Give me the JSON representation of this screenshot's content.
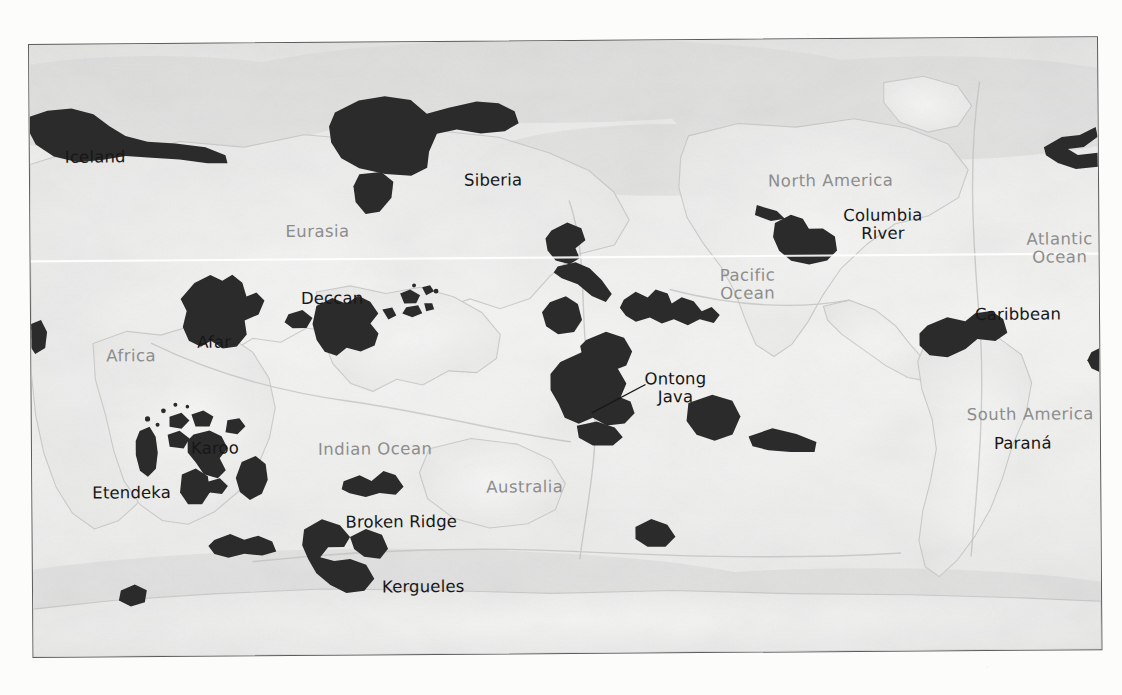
{
  "figure": {
    "type": "world-map",
    "projection": "equirectangular",
    "basemap_style": "grayscale shaded relief",
    "frame_border_color": "#5c5c5c",
    "lip_fill_color": "#2b2b2b",
    "region_label_color": "#8d8d8d",
    "lip_label_color": "#171717",
    "equator_line_color": "#ffffff"
  },
  "region_labels": [
    {
      "name": "eurasia",
      "text": "Eurasia",
      "x": 255,
      "y": 180
    },
    {
      "name": "north-america",
      "text": "North America",
      "x": 738,
      "y": 133
    },
    {
      "name": "pacific-ocean",
      "text": "Pacific",
      "text2": "Ocean",
      "x": 689,
      "y": 227
    },
    {
      "name": "atlantic-ocean",
      "text": "Atlantic",
      "text2": "Ocean",
      "x": 996,
      "y": 193
    },
    {
      "name": "africa",
      "text": "Africa",
      "x": 75,
      "y": 303
    },
    {
      "name": "south-america",
      "text": "South America",
      "x": 935,
      "y": 368
    },
    {
      "name": "indian-ocean",
      "text": "Indian Ocean",
      "x": 286,
      "y": 398
    },
    {
      "name": "australia",
      "text": "Australia",
      "x": 454,
      "y": 437
    },
    {
      "name": "antarctic",
      "text": "Antarctic",
      "x": 305,
      "y": 617
    }
  ],
  "lip_labels": [
    {
      "name": "iceland",
      "text": "Iceland",
      "x": 35,
      "y": 104
    },
    {
      "name": "siberia",
      "text": "Siberia",
      "x": 434,
      "y": 130
    },
    {
      "name": "columbia-river",
      "text": "Columbia",
      "text2": "River",
      "x": 813,
      "y": 168
    },
    {
      "name": "caribbean",
      "text": "Caribbean",
      "x": 944,
      "y": 268
    },
    {
      "name": "deccan",
      "text": "Deccan",
      "x": 270,
      "y": 247
    },
    {
      "name": "afar",
      "text": "Afar",
      "x": 166,
      "y": 290
    },
    {
      "name": "ontong-java",
      "text": "Ontong",
      "text2": "Java",
      "x": 613,
      "y": 330,
      "leader": true
    },
    {
      "name": "parana",
      "text": "Paraná",
      "x": 962,
      "y": 397
    },
    {
      "name": "karoo",
      "text": "Karoo",
      "x": 159,
      "y": 396
    },
    {
      "name": "etendeka",
      "text": "Etendeka",
      "x": 60,
      "y": 440
    },
    {
      "name": "broken-ridge",
      "text": "Broken Ridge",
      "x": 313,
      "y": 471
    },
    {
      "name": "kergueles",
      "text": "Kergueles",
      "x": 349,
      "y": 536
    }
  ],
  "equator": {
    "name": "equator-line",
    "y_fraction": 0.355
  }
}
